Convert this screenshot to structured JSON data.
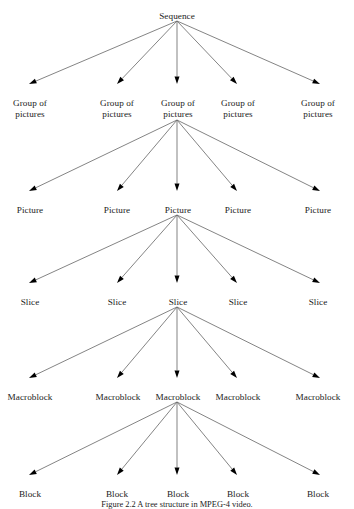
{
  "figure": {
    "caption": "Figure 2.2 A tree structure in MPEG-4 video.",
    "edge_color": "#6e6e6e",
    "arrow_color": "#000000",
    "background": "#ffffff"
  },
  "levels": [
    {
      "id": "sequence",
      "name": "Sequence",
      "y": 11,
      "nodes": [
        {
          "label": "Sequence",
          "x": 177,
          "lines": [
            "Sequence"
          ]
        }
      ]
    },
    {
      "id": "group-of-pictures",
      "name": "Group of pictures",
      "y": 98,
      "nodes": [
        {
          "label": "Group of pictures",
          "x": 30,
          "lines": [
            "Group of",
            "pictures"
          ]
        },
        {
          "label": "Group of pictures",
          "x": 117,
          "lines": [
            "Group of",
            "pictures"
          ]
        },
        {
          "label": "Group of pictures",
          "x": 178,
          "lines": [
            "Group of",
            "pictures"
          ]
        },
        {
          "label": "Group of pictures",
          "x": 238,
          "lines": [
            "Group of",
            "pictures"
          ]
        },
        {
          "label": "Group of pictures",
          "x": 318,
          "lines": [
            "Group of",
            "pictures"
          ]
        }
      ]
    },
    {
      "id": "picture",
      "name": "Picture",
      "y": 205,
      "nodes": [
        {
          "label": "Picture",
          "x": 30,
          "lines": [
            "Picture"
          ]
        },
        {
          "label": "Picture",
          "x": 117,
          "lines": [
            "Picture"
          ]
        },
        {
          "label": "Picture",
          "x": 178,
          "lines": [
            "Picture"
          ]
        },
        {
          "label": "Picture",
          "x": 238,
          "lines": [
            "Picture"
          ]
        },
        {
          "label": "Picture",
          "x": 318,
          "lines": [
            "Picture"
          ]
        }
      ]
    },
    {
      "id": "slice",
      "name": "Slice",
      "y": 297,
      "nodes": [
        {
          "label": "Slice",
          "x": 30,
          "lines": [
            "Slice"
          ]
        },
        {
          "label": "Slice",
          "x": 117,
          "lines": [
            "Slice"
          ]
        },
        {
          "label": "Slice",
          "x": 178,
          "lines": [
            "Slice"
          ]
        },
        {
          "label": "Slice",
          "x": 238,
          "lines": [
            "Slice"
          ]
        },
        {
          "label": "Slice",
          "x": 318,
          "lines": [
            "Slice"
          ]
        }
      ]
    },
    {
      "id": "macroblock",
      "name": "Macroblock",
      "y": 392,
      "nodes": [
        {
          "label": "Macroblock",
          "x": 30,
          "lines": [
            "Macroblock"
          ]
        },
        {
          "label": "Macroblock",
          "x": 118,
          "lines": [
            "Macroblock"
          ]
        },
        {
          "label": "Macroblock",
          "x": 178,
          "lines": [
            "Macroblock"
          ]
        },
        {
          "label": "Macroblock",
          "x": 238,
          "lines": [
            "Macroblock"
          ]
        },
        {
          "label": "Macroblock",
          "x": 318,
          "lines": [
            "Macroblock"
          ]
        }
      ]
    },
    {
      "id": "block",
      "name": "Block",
      "y": 489,
      "nodes": [
        {
          "label": "Block",
          "x": 30,
          "lines": [
            "Block"
          ]
        },
        {
          "label": "Block",
          "x": 117,
          "lines": [
            "Block"
          ]
        },
        {
          "label": "Block",
          "x": 178,
          "lines": [
            "Block"
          ]
        },
        {
          "label": "Block",
          "x": 238,
          "lines": [
            "Block"
          ]
        },
        {
          "label": "Block",
          "x": 318,
          "lines": [
            "Block"
          ]
        }
      ]
    }
  ],
  "edges": [
    {
      "from": "sequence",
      "from_x": 177,
      "from_y": 21,
      "to": "group-of-pictures",
      "to_x": 29,
      "to_y": 84
    },
    {
      "from": "sequence",
      "from_x": 177,
      "from_y": 21,
      "to": "group-of-pictures",
      "to_x": 117,
      "to_y": 84
    },
    {
      "from": "sequence",
      "from_x": 177,
      "from_y": 21,
      "to": "group-of-pictures",
      "to_x": 177,
      "to_y": 84
    },
    {
      "from": "sequence",
      "from_x": 177,
      "from_y": 21,
      "to": "group-of-pictures",
      "to_x": 237,
      "to_y": 84
    },
    {
      "from": "sequence",
      "from_x": 177,
      "from_y": 21,
      "to": "group-of-pictures",
      "to_x": 320,
      "to_y": 84
    },
    {
      "from": "group-of-pictures",
      "from_x": 177,
      "from_y": 120,
      "to": "picture",
      "to_x": 29,
      "to_y": 191
    },
    {
      "from": "group-of-pictures",
      "from_x": 177,
      "from_y": 120,
      "to": "picture",
      "to_x": 117,
      "to_y": 191
    },
    {
      "from": "group-of-pictures",
      "from_x": 177,
      "from_y": 120,
      "to": "picture",
      "to_x": 177,
      "to_y": 191
    },
    {
      "from": "group-of-pictures",
      "from_x": 177,
      "from_y": 120,
      "to": "picture",
      "to_x": 237,
      "to_y": 191
    },
    {
      "from": "group-of-pictures",
      "from_x": 177,
      "from_y": 120,
      "to": "picture",
      "to_x": 320,
      "to_y": 191
    },
    {
      "from": "picture",
      "from_x": 177,
      "from_y": 215,
      "to": "slice",
      "to_x": 29,
      "to_y": 283
    },
    {
      "from": "picture",
      "from_x": 177,
      "from_y": 215,
      "to": "slice",
      "to_x": 117,
      "to_y": 283
    },
    {
      "from": "picture",
      "from_x": 177,
      "from_y": 215,
      "to": "slice",
      "to_x": 177,
      "to_y": 283
    },
    {
      "from": "picture",
      "from_x": 177,
      "from_y": 215,
      "to": "slice",
      "to_x": 237,
      "to_y": 283
    },
    {
      "from": "picture",
      "from_x": 177,
      "from_y": 215,
      "to": "slice",
      "to_x": 320,
      "to_y": 283
    },
    {
      "from": "slice",
      "from_x": 177,
      "from_y": 307,
      "to": "macroblock",
      "to_x": 29,
      "to_y": 378
    },
    {
      "from": "slice",
      "from_x": 177,
      "from_y": 307,
      "to": "macroblock",
      "to_x": 117,
      "to_y": 378
    },
    {
      "from": "slice",
      "from_x": 177,
      "from_y": 307,
      "to": "macroblock",
      "to_x": 177,
      "to_y": 378
    },
    {
      "from": "slice",
      "from_x": 177,
      "from_y": 307,
      "to": "macroblock",
      "to_x": 237,
      "to_y": 378
    },
    {
      "from": "slice",
      "from_x": 177,
      "from_y": 307,
      "to": "macroblock",
      "to_x": 320,
      "to_y": 378
    },
    {
      "from": "macroblock",
      "from_x": 177,
      "from_y": 402,
      "to": "block",
      "to_x": 29,
      "to_y": 475
    },
    {
      "from": "macroblock",
      "from_x": 177,
      "from_y": 402,
      "to": "block",
      "to_x": 117,
      "to_y": 475
    },
    {
      "from": "macroblock",
      "from_x": 177,
      "from_y": 402,
      "to": "block",
      "to_x": 177,
      "to_y": 475
    },
    {
      "from": "macroblock",
      "from_x": 177,
      "from_y": 402,
      "to": "block",
      "to_x": 237,
      "to_y": 475
    },
    {
      "from": "macroblock",
      "from_x": 177,
      "from_y": 402,
      "to": "block",
      "to_x": 320,
      "to_y": 475
    }
  ]
}
